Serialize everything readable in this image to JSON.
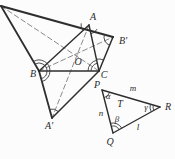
{
  "theme": {
    "background": "#fcfcfc",
    "solid_line_color": "#2e2e2e",
    "dashed_line_color": "#8a8a8a",
    "arc_color": "#3a3a3a",
    "label_color": "#2b2b2b"
  },
  "diagram": {
    "points": [
      {
        "id": "Cp",
        "label": "",
        "x": 1,
        "y": 6,
        "lx": 0,
        "ly": 0
      },
      {
        "id": "A",
        "label": "A",
        "x": 89,
        "y": 25,
        "lx": 93,
        "ly": 20
      },
      {
        "id": "Bp",
        "label": "B'",
        "x": 113,
        "y": 37,
        "lx": 123,
        "ly": 44
      },
      {
        "id": "B",
        "label": "B",
        "x": 39,
        "y": 71,
        "lx": 33,
        "ly": 77
      },
      {
        "id": "C",
        "label": "C",
        "x": 99,
        "y": 71,
        "lx": 104,
        "ly": 78
      },
      {
        "id": "Ap",
        "label": "A'",
        "x": 52,
        "y": 118,
        "lx": 49,
        "ly": 129
      },
      {
        "id": "O",
        "label": "O",
        "x": 73,
        "y": 56,
        "lx": 78,
        "ly": 65
      },
      {
        "id": "P",
        "label": "P",
        "x": 102,
        "y": 90,
        "lx": 97,
        "ly": 88
      },
      {
        "id": "Q",
        "label": "Q",
        "x": 113,
        "y": 133,
        "lx": 110,
        "ly": 145
      },
      {
        "id": "R",
        "label": "R",
        "x": 160,
        "y": 107,
        "lx": 168,
        "ly": 110
      }
    ],
    "solid_segments": [
      {
        "from": "Cp",
        "to": "Bp",
        "width": 2.2
      },
      {
        "from": "Cp",
        "to": "B",
        "width": 1.8
      },
      {
        "from": "B",
        "to": "Ap",
        "width": 1.8
      },
      {
        "from": "Ap",
        "to": "C",
        "width": 1.5
      },
      {
        "from": "C",
        "to": "Bp",
        "width": 1.5
      },
      {
        "from": "A",
        "to": "B",
        "width": 1.4
      },
      {
        "from": "B",
        "to": "C",
        "width": 1.4
      },
      {
        "from": "A",
        "to": "C",
        "width": 1.4
      },
      {
        "from": "P",
        "to": "Q",
        "width": 1.4
      },
      {
        "from": "Q",
        "to": "R",
        "width": 1.4
      },
      {
        "from": "R",
        "to": "P",
        "width": 1.4
      }
    ],
    "dashed_segments": [
      {
        "from": "Cp",
        "to": "C"
      },
      {
        "from": "A",
        "to": "Ap"
      },
      {
        "from": "B",
        "to": "Bp"
      }
    ],
    "angle_arcs": [
      {
        "at": "A",
        "r": 8,
        "a1": 137,
        "a2": 192,
        "double": false
      },
      {
        "at": "A",
        "r": 9,
        "a1": 27,
        "a2": 78,
        "double": false
      },
      {
        "at": "B",
        "r": 8,
        "a1": 240,
        "a2": 360,
        "double": true
      },
      {
        "at": "B",
        "r": 8,
        "a1": 0,
        "a2": 75,
        "double": true
      },
      {
        "at": "C",
        "r": 8,
        "a1": 180,
        "a2": 258,
        "double": true
      },
      {
        "at": "C",
        "r": 12,
        "a1": 258,
        "a2": 292,
        "double": false
      },
      {
        "at": "Bp",
        "r": 9,
        "a1": 112,
        "a2": 196,
        "double": false
      },
      {
        "at": "Ap",
        "r": 9,
        "a1": 255,
        "a2": 315,
        "double": false
      },
      {
        "at": "P",
        "r": 8,
        "a1": 16,
        "a2": 76,
        "double": false
      },
      {
        "at": "Q",
        "r": 7,
        "a1": 256,
        "a2": 331,
        "double": true
      },
      {
        "at": "R",
        "r": 7,
        "a1": 151,
        "a2": 196,
        "double": true
      }
    ],
    "text_labels": [
      {
        "id": "alpha",
        "text": "α",
        "x": 108,
        "y": 99,
        "size": 9
      },
      {
        "id": "beta",
        "text": "β",
        "x": 117,
        "y": 122,
        "size": 9
      },
      {
        "id": "gamma",
        "text": "γ",
        "x": 146,
        "y": 110,
        "size": 9
      },
      {
        "id": "T",
        "text": "T",
        "x": 120,
        "y": 107,
        "size": 10
      },
      {
        "id": "m",
        "text": "m",
        "x": 133,
        "y": 91,
        "size": 9
      },
      {
        "id": "n",
        "text": "n",
        "x": 101,
        "y": 116,
        "size": 9
      },
      {
        "id": "l",
        "text": "l",
        "x": 138,
        "y": 130,
        "size": 9
      }
    ]
  }
}
